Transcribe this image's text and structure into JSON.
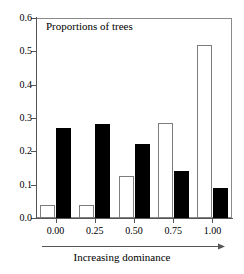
{
  "chart_data": {
    "type": "bar",
    "title": "Proportions of trees",
    "xlabel": "Increasing dominance",
    "ylabel": "",
    "categories": [
      "0.00",
      "0.25",
      "0.50",
      "0.75",
      "1.00"
    ],
    "series": [
      {
        "name": "open",
        "style": "open",
        "values": [
          0.04,
          0.04,
          0.125,
          0.285,
          0.52
        ]
      },
      {
        "name": "filled",
        "style": "filled",
        "values": [
          0.27,
          0.283,
          0.222,
          0.142,
          0.089
        ]
      }
    ],
    "ylim": [
      0.0,
      0.6
    ],
    "yticks": [
      "0.0",
      "0.1",
      "0.2",
      "0.3",
      "0.4",
      "0.5",
      "0.6"
    ],
    "ytick_values": [
      0.0,
      0.1,
      0.2,
      0.3,
      0.4,
      0.5,
      0.6
    ],
    "xticks": [
      "0.00",
      "0.25",
      "0.50",
      "0.75",
      "1.00"
    ],
    "grid": false,
    "legend": "none",
    "annotation_arrow": "left-to-right"
  },
  "colors": {
    "filled_bar": "#000000",
    "open_bar_fill": "#ffffff",
    "open_bar_edge": "#7d7d7d",
    "axis": "#555555",
    "frame": "#8a8a8a",
    "text": "#000000"
  }
}
